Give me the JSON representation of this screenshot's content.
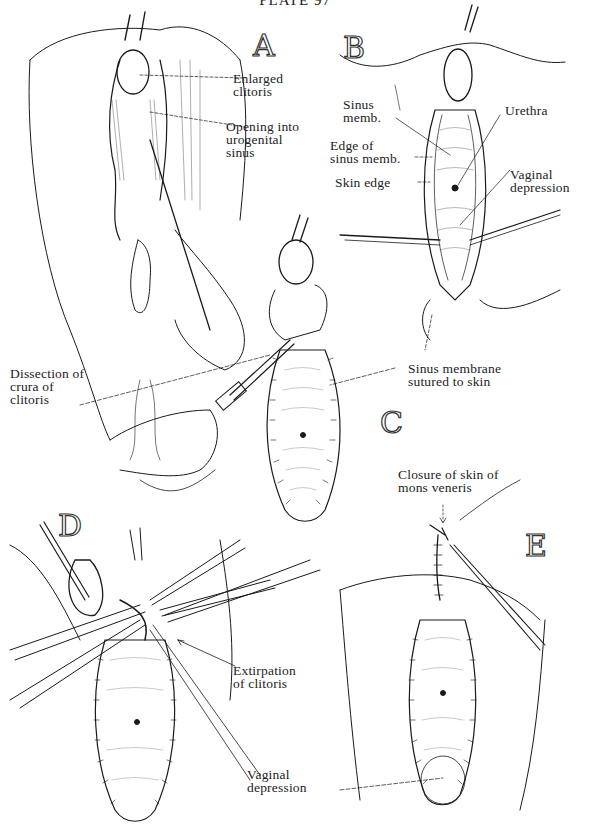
{
  "plate": {
    "title": "PLATE 97"
  },
  "panels": [
    {
      "id": "A",
      "letter": "A",
      "labels": [
        {
          "text": "Enlarged\nclitoris"
        },
        {
          "text": "Opening into\nurogenital\nsinus"
        }
      ]
    },
    {
      "id": "B",
      "letter": "B",
      "labels": [
        {
          "text": "Sinus\nmemb."
        },
        {
          "text": "Edge of\nsinus memb."
        },
        {
          "text": "Skin edge"
        },
        {
          "text": "Urethra"
        },
        {
          "text": "Vaginal\ndepression"
        }
      ]
    },
    {
      "id": "C",
      "letter": "C",
      "labels": [
        {
          "text": "Dissection of\ncrura of\nclitoris"
        },
        {
          "text": "Sinus membrane\nsutured to skin"
        }
      ]
    },
    {
      "id": "D",
      "letter": "D",
      "labels": [
        {
          "text": "Extirpation\nof clitoris"
        }
      ]
    },
    {
      "id": "E",
      "letter": "E",
      "labels": [
        {
          "text": "Closure of skin of\nmons veneris"
        },
        {
          "text": "Vaginal\ndepression"
        }
      ]
    }
  ],
  "style": {
    "ink": "#1a1a1a",
    "paper": "#ffffff"
  }
}
